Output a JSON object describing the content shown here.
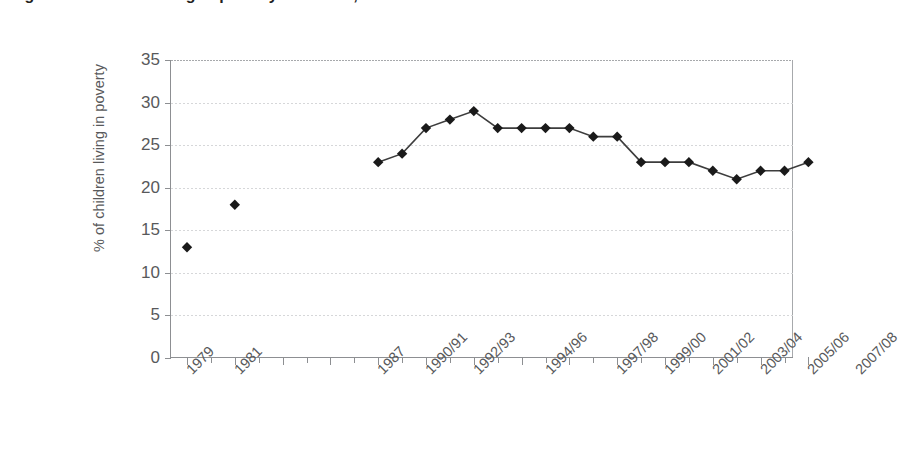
{
  "chart_data": {
    "type": "line",
    "title": "Figure 1: Children living in poverty in the UK, 1979 to 2007/08",
    "ylabel": "% of children living in poverty",
    "xlabel": "",
    "ylim": [
      0,
      35
    ],
    "ytick_step": 5,
    "ytick_labels": [
      "0",
      "5",
      "10",
      "15",
      "20",
      "25",
      "30",
      "35"
    ],
    "grid": true,
    "grid_axis": "y",
    "legend": "none",
    "marker": "diamond",
    "marker_color": "#1a1a1a",
    "line_color": "#3d3d3d",
    "axis_color": "#8d8f92",
    "text_color": "#58595b",
    "background": "#ffffff",
    "xtick_labels": [
      "1979",
      "1981",
      "",
      "",
      "1987",
      "1990/91",
      "1992/93",
      "1994/96",
      "1997/98",
      "1999/00",
      "2001/02",
      "2003/04",
      "2005/06",
      "2007/08"
    ],
    "categories": [
      "1979",
      "1981",
      "1987",
      "1988/89",
      "1990/91",
      "1991/92",
      "1992/93",
      "1993/94",
      "1994/95",
      "1994/96",
      "1995/97",
      "1996/98",
      "1997/98",
      "1998/99",
      "1999/00",
      "2000/01",
      "2001/02",
      "2002/03",
      "2003/04",
      "2004/05",
      "2005/06"
    ],
    "series": [
      {
        "name": "% of children living in poverty",
        "connected": false,
        "points": [
          {
            "x_index": 0,
            "label": "1979",
            "value": 13
          },
          {
            "x_index": 2,
            "label": "1981",
            "value": 18
          }
        ]
      },
      {
        "name": "% of children living in poverty (continuous)",
        "connected": true,
        "points": [
          {
            "x_index": 8,
            "label": "1987",
            "value": 23
          },
          {
            "x_index": 9,
            "label": "1988/89",
            "value": 24
          },
          {
            "x_index": 10,
            "label": "1990/91",
            "value": 27
          },
          {
            "x_index": 11,
            "label": "1991/92",
            "value": 28
          },
          {
            "x_index": 12,
            "label": "1992/93",
            "value": 29
          },
          {
            "x_index": 13,
            "label": "1993/94",
            "value": 27
          },
          {
            "x_index": 14,
            "label": "1994/95",
            "value": 27
          },
          {
            "x_index": 15,
            "label": "1994/96",
            "value": 27
          },
          {
            "x_index": 16,
            "label": "1995/97",
            "value": 27
          },
          {
            "x_index": 17,
            "label": "1996/98",
            "value": 26
          },
          {
            "x_index": 18,
            "label": "1997/98",
            "value": 26
          },
          {
            "x_index": 19,
            "label": "1998/99",
            "value": 23
          },
          {
            "x_index": 20,
            "label": "1999/00",
            "value": 23
          },
          {
            "x_index": 21,
            "label": "2000/01",
            "value": 23
          },
          {
            "x_index": 22,
            "label": "2001/02",
            "value": 22
          },
          {
            "x_index": 23,
            "label": "2002/03",
            "value": 21
          },
          {
            "x_index": 24,
            "label": "2003/04",
            "value": 22
          },
          {
            "x_index": 25,
            "label": "2004/05",
            "value": 22
          },
          {
            "x_index": 26,
            "label": "2005/06",
            "value": 23
          }
        ]
      }
    ]
  }
}
